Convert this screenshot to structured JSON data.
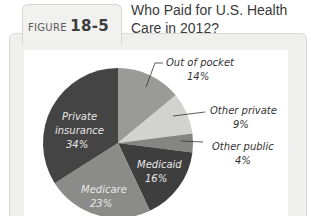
{
  "figure": {
    "label_prefix": "FIGURE",
    "number": "18-5",
    "title_line1": "Who Paid for U.S. Health",
    "title_line2": "Care in 2012?"
  },
  "chart_data": {
    "type": "pie",
    "slices": [
      {
        "name": "Out of pocket",
        "value": 14,
        "label": "14%",
        "color": "#9a9a98"
      },
      {
        "name": "Other private",
        "value": 9,
        "label": "9%",
        "color": "#d2d2d0"
      },
      {
        "name": "Other public",
        "value": 4,
        "label": "4%",
        "color": "#858583"
      },
      {
        "name": "Medicaid",
        "value": 16,
        "label": "16%",
        "color": "#3e3e3e"
      },
      {
        "name": "Medicare",
        "value": 23,
        "label": "23%",
        "color": "#8b8b89"
      },
      {
        "name": "Private insurance",
        "value": 34,
        "label": "34%",
        "color": "#444444"
      }
    ],
    "start_angle_deg": 0,
    "direction": "clockwise",
    "labels": {
      "out_of_pocket": {
        "line1": "Out of pocket",
        "line2": "14%"
      },
      "other_private": {
        "line1": "Other private",
        "line2": "9%"
      },
      "other_public": {
        "line1": "Other public",
        "line2": "4%"
      },
      "medicaid": {
        "line1": "Medicaid",
        "line2": "16%"
      },
      "medicare": {
        "line1": "Medicare",
        "line2": "23%"
      },
      "private_insurance": {
        "line1": "Private",
        "line2": "insurance",
        "line3": "34%"
      }
    }
  }
}
